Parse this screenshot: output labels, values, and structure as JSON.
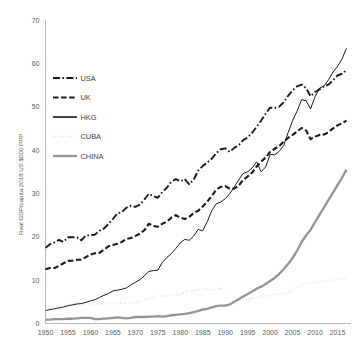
{
  "chart_data": {
    "type": "line",
    "title": "",
    "subtitle": "",
    "xlabel": "",
    "ylabel": "Real GDP/capita 2018 US $000 PPP",
    "xlim": [
      1950,
      2018
    ],
    "ylim": [
      0,
      70
    ],
    "grid": false,
    "legend_position": "upper-left-inside",
    "yticks": [
      0,
      10,
      20,
      30,
      40,
      50,
      60,
      70
    ],
    "ytick_labels": [
      "0",
      "10",
      "20",
      "30",
      "40",
      "50",
      "60",
      "70"
    ],
    "xticks": [
      1950,
      1955,
      1960,
      1965,
      1970,
      1975,
      1980,
      1985,
      1990,
      1995,
      2000,
      2005,
      2010,
      2015
    ],
    "xtick_labels": [
      "1950",
      "1955",
      "1960",
      "1965",
      "1970",
      "1975",
      "1980",
      "1985",
      "1990",
      "1995",
      "2000",
      "2005",
      "2010",
      "2015"
    ],
    "x": [
      1950,
      1951,
      1952,
      1953,
      1954,
      1955,
      1956,
      1957,
      1958,
      1959,
      1960,
      1961,
      1962,
      1963,
      1964,
      1965,
      1966,
      1967,
      1968,
      1969,
      1970,
      1971,
      1972,
      1973,
      1974,
      1975,
      1976,
      1977,
      1978,
      1979,
      1980,
      1981,
      1982,
      1983,
      1984,
      1985,
      1986,
      1987,
      1988,
      1989,
      1990,
      1991,
      1992,
      1993,
      1994,
      1995,
      1996,
      1997,
      1998,
      1999,
      2000,
      2001,
      2002,
      2003,
      2004,
      2005,
      2006,
      2007,
      2008,
      2009,
      2010,
      2011,
      2012,
      2013,
      2014,
      2015,
      2016,
      2017
    ],
    "series": [
      {
        "name": "USA",
        "style": "dash-dot",
        "color": "#1a1a1a",
        "values": [
          17.5,
          18.3,
          18.7,
          19.3,
          18.8,
          19.9,
          19.9,
          19.9,
          19.2,
          20.3,
          20.4,
          20.5,
          21.4,
          21.9,
          22.9,
          24.1,
          25.4,
          25.7,
          26.7,
          27.2,
          26.9,
          27.4,
          28.6,
          29.9,
          29.4,
          29.0,
          30.3,
          31.3,
          32.7,
          33.3,
          32.8,
          33.3,
          32.1,
          33.2,
          35.3,
          36.3,
          37.1,
          38.0,
          39.3,
          40.2,
          40.4,
          39.6,
          40.5,
          41.1,
          42.3,
          42.9,
          44.0,
          45.4,
          46.8,
          48.4,
          49.8,
          49.7,
          50.0,
          51.0,
          52.5,
          53.8,
          54.7,
          55.1,
          54.3,
          52.4,
          53.4,
          54.0,
          54.7,
          55.1,
          56.1,
          57.2,
          57.6,
          58.4
        ]
      },
      {
        "name": "UK",
        "style": "dashed",
        "color": "#1a1a1a",
        "values": [
          12.5,
          12.8,
          12.8,
          13.3,
          13.9,
          14.4,
          14.5,
          14.7,
          14.7,
          15.3,
          15.9,
          16.2,
          16.3,
          17.0,
          17.8,
          18.1,
          18.4,
          18.8,
          19.5,
          19.7,
          20.2,
          20.7,
          21.5,
          23.0,
          22.5,
          22.3,
          23.0,
          23.5,
          24.4,
          25.0,
          24.4,
          24.1,
          24.6,
          25.5,
          26.0,
          27.0,
          28.1,
          29.4,
          30.9,
          31.5,
          31.7,
          31.1,
          31.1,
          31.8,
          33.1,
          33.9,
          34.8,
          36.2,
          37.3,
          38.3,
          39.6,
          40.3,
          40.9,
          41.9,
          42.8,
          43.5,
          44.3,
          45.1,
          44.5,
          42.5,
          43.1,
          43.5,
          43.6,
          44.1,
          45.0,
          45.7,
          46.2,
          46.8
        ]
      },
      {
        "name": "HKG",
        "style": "solid-thin",
        "color": "#1a1a1a",
        "values": [
          3.0,
          3.2,
          3.4,
          3.6,
          3.8,
          4.1,
          4.3,
          4.5,
          4.6,
          4.9,
          5.2,
          5.5,
          6.0,
          6.5,
          6.9,
          7.5,
          7.7,
          7.9,
          8.2,
          8.9,
          9.5,
          10.1,
          11.0,
          12.0,
          12.2,
          12.3,
          14.1,
          15.2,
          16.1,
          17.3,
          18.6,
          19.4,
          19.2,
          20.2,
          21.7,
          21.4,
          23.5,
          26.0,
          27.6,
          28.0,
          28.8,
          29.9,
          31.5,
          33.1,
          34.6,
          35.0,
          35.9,
          37.3,
          35.0,
          36.1,
          39.0,
          38.9,
          39.7,
          41.0,
          44.0,
          46.8,
          49.0,
          51.6,
          51.4,
          49.5,
          52.3,
          54.3,
          54.8,
          56.2,
          58.0,
          59.3,
          61.0,
          63.5
        ]
      },
      {
        "name": "CUBA",
        "style": "dotted",
        "color": "#1a1a1a",
        "values": [
          4.0,
          4.1,
          4.1,
          4.0,
          4.2,
          4.3,
          4.5,
          4.7,
          4.6,
          4.6,
          4.5,
          4.5,
          4.4,
          4.4,
          4.6,
          4.7,
          4.6,
          4.8,
          4.7,
          4.7,
          4.9,
          5.1,
          5.5,
          5.8,
          6.0,
          6.3,
          6.3,
          6.4,
          6.7,
          6.7,
          6.6,
          7.2,
          7.4,
          7.6,
          7.9,
          7.9,
          7.9,
          7.7,
          7.9,
          8.0,
          7.8,
          6.9,
          6.0,
          5.2,
          5.3,
          5.5,
          5.9,
          6.0,
          6.1,
          6.3,
          6.6,
          6.7,
          6.8,
          6.9,
          7.2,
          7.9,
          8.4,
          8.9,
          9.2,
          9.3,
          9.4,
          9.6,
          9.8,
          9.9,
          10.0,
          10.2,
          10.3,
          10.4
        ]
      },
      {
        "name": "CHINA",
        "style": "solid-thick",
        "color": "#949494",
        "values": [
          0.9,
          0.9,
          1.0,
          1.0,
          1.0,
          1.1,
          1.1,
          1.2,
          1.3,
          1.3,
          1.3,
          1.0,
          1.0,
          1.1,
          1.2,
          1.3,
          1.4,
          1.3,
          1.2,
          1.3,
          1.5,
          1.5,
          1.5,
          1.6,
          1.6,
          1.7,
          1.6,
          1.7,
          1.9,
          2.0,
          2.1,
          2.2,
          2.4,
          2.6,
          2.9,
          3.2,
          3.4,
          3.7,
          4.0,
          4.1,
          4.1,
          4.4,
          5.0,
          5.6,
          6.2,
          6.8,
          7.4,
          8.0,
          8.5,
          9.1,
          9.8,
          10.5,
          11.4,
          12.5,
          13.7,
          15.1,
          16.8,
          18.8,
          20.3,
          21.6,
          23.4,
          25.1,
          26.8,
          28.5,
          30.2,
          31.9,
          33.6,
          35.5
        ]
      }
    ]
  },
  "legend": {
    "items": [
      {
        "label": "USA",
        "key": "legend-item-usa"
      },
      {
        "label": "UK",
        "key": "legend-item-uk"
      },
      {
        "label": "HKG",
        "key": "legend-item-hkg"
      },
      {
        "label": "CUBA",
        "key": "legend-item-cuba"
      },
      {
        "label": "CHINA",
        "key": "legend-item-china"
      }
    ]
  },
  "axes": {
    "y_title": "Real GDP/capita 2018 US $000 PPP"
  }
}
